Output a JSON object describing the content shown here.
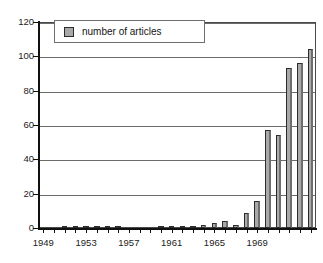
{
  "chart_data": {
    "type": "bar",
    "title": "",
    "xlabel": "",
    "ylabel": "",
    "ylim": [
      0,
      120
    ],
    "ytick_values": [
      0,
      20,
      40,
      60,
      80,
      100,
      120
    ],
    "ytick_labels": [
      "0",
      "20",
      "40",
      "60",
      "80",
      "100",
      "120"
    ],
    "grid": true,
    "grid_axis": "y",
    "legend_position": "top-left",
    "legend_entries": [
      "number of articles"
    ],
    "series_name": "number of articles",
    "bar_color": "#a9a9a9",
    "bar_edge_color": "#2b2b2b",
    "axis_color": "#111111",
    "grid_color": "#6b6b6b",
    "categories": [
      "1949",
      "1950",
      "1951",
      "1952",
      "1953",
      "1954",
      "1955",
      "1956",
      "1957",
      "1958",
      "1959",
      "1960",
      "1961",
      "1962",
      "1963",
      "1964",
      "1965",
      "1966",
      "1967",
      "1968",
      "1969",
      "1970",
      "1971",
      "1972",
      "1973"
    ],
    "values": [
      0,
      0,
      1,
      1,
      1,
      1,
      1,
      1,
      0,
      0,
      0,
      1,
      1,
      1,
      1,
      2,
      3,
      4,
      2,
      9,
      16,
      57,
      54,
      93,
      96
    ],
    "values_tail": [
      104
    ],
    "xtick_labels_shown": [
      "1949",
      "1953",
      "1957",
      "1961",
      "1965",
      "1969"
    ],
    "xtick_label_step_years": 4,
    "x_range": [
      1949,
      1974
    ]
  },
  "legend": {
    "label": "number of articles",
    "swatch_color": "#a9a9a9"
  },
  "axes": {
    "y_labels": [
      "120",
      "100",
      "80",
      "60",
      "40",
      "20",
      "0"
    ],
    "x_labels": [
      "1949",
      "1953",
      "1957",
      "1961",
      "1965",
      "1969"
    ]
  }
}
